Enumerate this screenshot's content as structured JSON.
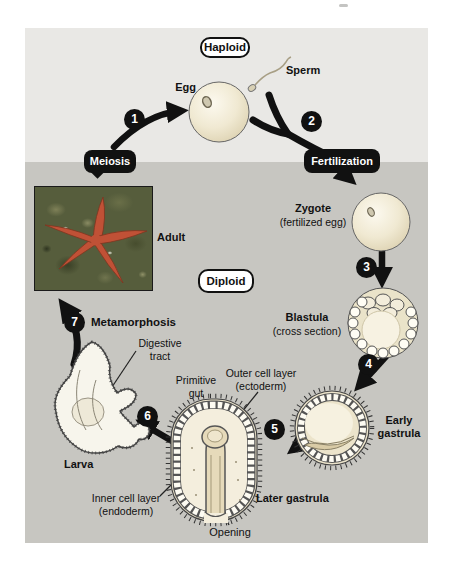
{
  "figure": {
    "zones": {
      "haploid": "Haploid",
      "diploid": "Diploid"
    },
    "process_labels": {
      "meiosis": "Meiosis",
      "fertilization": "Fertilization",
      "metamorphosis": "Metamorphosis"
    },
    "steps": [
      "1",
      "2",
      "3",
      "4",
      "5",
      "6",
      "7"
    ],
    "stages": {
      "egg": "Egg",
      "sperm": "Sperm",
      "zygote": {
        "name": "Zygote",
        "sub": "(fertilized egg)"
      },
      "blastula": {
        "name": "Blastula",
        "sub": "(cross section)"
      },
      "early_gastrula": {
        "line1": "Early",
        "line2": "gastrula"
      },
      "later_gastrula": "Later gastrula",
      "larva": "Larva",
      "adult": "Adult"
    },
    "annotations": {
      "digestive_tract": {
        "line1": "Digestive",
        "line2": "tract"
      },
      "primitive_gut": {
        "line1": "Primitive",
        "line2": "gut"
      },
      "outer_cell_layer": {
        "line1": "Outer cell layer",
        "line2": "(ectoderm)"
      },
      "inner_cell_layer": {
        "line1": "Inner cell layer",
        "line2": "(endoderm)"
      },
      "opening": "Opening"
    },
    "colors": {
      "page_bg": "#ffffff",
      "haploid_zone": "#e9e8e5",
      "diploid_zone": "#c7c6c1",
      "label_black": "#111111",
      "text": "#111111",
      "embryo_cream": "#ece4cb",
      "sea_star": "#c05136"
    }
  }
}
